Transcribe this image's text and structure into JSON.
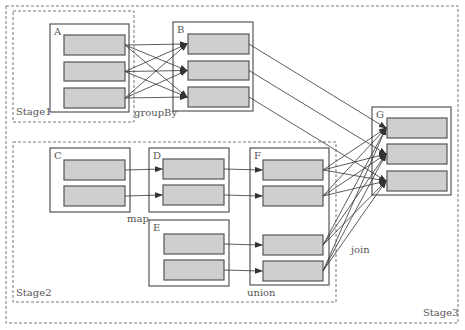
{
  "diagram": {
    "stages": [
      {
        "id": "stage1",
        "label": "Stage1",
        "x": 13,
        "y": 11,
        "w": 121,
        "h": 111,
        "lx": 16,
        "ly": 115
      },
      {
        "id": "stage2",
        "label": "Stage2",
        "x": 13,
        "y": 142,
        "w": 323,
        "h": 160,
        "lx": 16,
        "ly": 296
      },
      {
        "id": "stage3",
        "label": "Stage3",
        "x": 6,
        "y": 6,
        "w": 452,
        "h": 317,
        "lx": 423,
        "ly": 316
      }
    ],
    "rdds": [
      {
        "id": "A",
        "label": "A",
        "x": 50,
        "y": 24,
        "w": 79,
        "h": 88,
        "parts": [
          [
            64,
            35,
            61,
            20
          ],
          [
            64,
            62,
            61,
            19
          ],
          [
            64,
            88,
            61,
            20
          ]
        ]
      },
      {
        "id": "B",
        "label": "B",
        "x": 173,
        "y": 22,
        "w": 80,
        "h": 89,
        "parts": [
          [
            188,
            34,
            61,
            20
          ],
          [
            188,
            61,
            61,
            19
          ],
          [
            188,
            87,
            61,
            20
          ]
        ]
      },
      {
        "id": "C",
        "label": "C",
        "x": 50,
        "y": 148,
        "w": 80,
        "h": 64,
        "parts": [
          [
            64,
            160,
            61,
            20
          ],
          [
            64,
            186,
            61,
            20
          ]
        ]
      },
      {
        "id": "D",
        "label": "D",
        "x": 149,
        "y": 148,
        "w": 80,
        "h": 64,
        "parts": [
          [
            163,
            159,
            61,
            20
          ],
          [
            163,
            185,
            61,
            20
          ]
        ]
      },
      {
        "id": "E",
        "label": "E",
        "x": 149,
        "y": 220,
        "w": 80,
        "h": 66,
        "parts": [
          [
            164,
            234,
            60,
            20
          ],
          [
            164,
            260,
            60,
            20
          ]
        ]
      },
      {
        "id": "F",
        "label": "F",
        "x": 250,
        "y": 148,
        "w": 79,
        "h": 137,
        "parts": [
          [
            263,
            160,
            60,
            20
          ],
          [
            263,
            186,
            60,
            20
          ],
          [
            263,
            235,
            60,
            20
          ],
          [
            263,
            261,
            60,
            20
          ]
        ]
      },
      {
        "id": "G",
        "label": "G",
        "x": 372,
        "y": 107,
        "w": 79,
        "h": 88,
        "parts": [
          [
            387,
            118,
            60,
            20
          ],
          [
            387,
            144,
            60,
            20
          ],
          [
            387,
            171,
            60,
            20
          ]
        ]
      }
    ],
    "operations": [
      {
        "label": "groupBy",
        "x": 134,
        "y": 116
      },
      {
        "label": "map",
        "x": 127,
        "y": 222
      },
      {
        "label": "union",
        "x": 247,
        "y": 296
      },
      {
        "label": "join",
        "x": 351,
        "y": 253
      }
    ],
    "colors": {
      "partition_fill": "#cfcfcf",
      "border": "#555555",
      "dashed": "#777777",
      "arrow": "#333333"
    }
  }
}
